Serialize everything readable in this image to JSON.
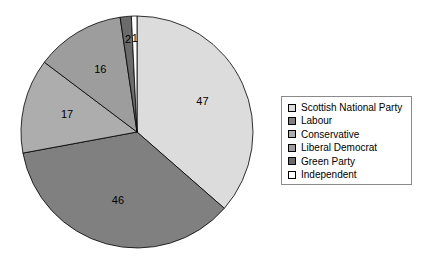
{
  "chart_data": {
    "type": "pie",
    "title": "",
    "subtitle": "",
    "xlabel": "",
    "ylabel": "",
    "grid": false,
    "legend_position": "right",
    "start_angle_deg": 0,
    "direction": "clockwise",
    "total": 129,
    "categories": [
      "Scottish National Party",
      "Labour",
      "Conservative",
      "Liberal Democrat",
      "Green Party",
      "Independent"
    ],
    "values": [
      47,
      46,
      17,
      16,
      2,
      1
    ],
    "data_labels": [
      "47",
      "46",
      "17",
      "16",
      "2",
      "1"
    ],
    "colors": [
      "#DCDCDC",
      "#808080",
      "#ADADAD",
      "#9D9D9D",
      "#6B6B6B",
      "#FFFFFF"
    ],
    "slices": [
      {
        "label": "Scottish National Party",
        "value": 47,
        "data_label": "47",
        "color": "#DCDCDC"
      },
      {
        "label": "Labour",
        "value": 46,
        "data_label": "46",
        "color": "#808080"
      },
      {
        "label": "Conservative",
        "value": 17,
        "data_label": "17",
        "color": "#ADADAD"
      },
      {
        "label": "Liberal Democrat",
        "value": 16,
        "data_label": "16",
        "color": "#9D9D9D"
      },
      {
        "label": "Green Party",
        "value": 2,
        "data_label": "2",
        "color": "#6B6B6B"
      },
      {
        "label": "Independent",
        "value": 1,
        "data_label": "1",
        "color": "#FFFFFF"
      }
    ]
  },
  "legend": {
    "items": [
      {
        "label": "Scottish National Party",
        "color": "#DCDCDC"
      },
      {
        "label": "Labour",
        "color": "#808080"
      },
      {
        "label": "Conservative",
        "color": "#ADADAD"
      },
      {
        "label": "Liberal Democrat",
        "color": "#9D9D9D"
      },
      {
        "label": "Green Party",
        "color": "#6B6B6B"
      },
      {
        "label": "Independent",
        "color": "#FFFFFF"
      }
    ]
  },
  "geometry": {
    "center_x": 137,
    "center_y": 132,
    "radius": 116,
    "label_radius_fraction": 0.62
  }
}
